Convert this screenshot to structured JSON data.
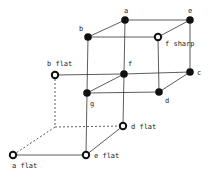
{
  "diagram": {
    "type": "key-relationship cube",
    "nodes": [
      {
        "id": "a",
        "label": "a",
        "x": 125,
        "y": 20,
        "style": "filled",
        "lx": 124,
        "ly": 13
      },
      {
        "id": "e",
        "label": "e",
        "x": 190,
        "y": 20,
        "style": "filled",
        "lx": 188,
        "ly": 13
      },
      {
        "id": "b",
        "label": "b",
        "x": 88,
        "y": 37,
        "style": "filled",
        "lx": 79,
        "ly": 31
      },
      {
        "id": "f_sharp",
        "label": "f sharp",
        "x": 158,
        "y": 37,
        "style": "open",
        "lx": 165,
        "ly": 46
      },
      {
        "id": "f",
        "label": "f",
        "x": 124,
        "y": 74,
        "style": "filled",
        "lx": 128,
        "ly": 66
      },
      {
        "id": "c",
        "label": "c",
        "x": 190,
        "y": 72,
        "style": "filled",
        "lx": 197,
        "ly": 75
      },
      {
        "id": "b_flat",
        "label": "b flat",
        "x": 55,
        "y": 75,
        "style": "open",
        "lx": 47,
        "ly": 66
      },
      {
        "id": "g",
        "label": "g",
        "x": 87,
        "y": 93,
        "style": "filled",
        "lx": 90,
        "ly": 106
      },
      {
        "id": "d",
        "label": "d",
        "x": 159,
        "y": 92,
        "style": "filled",
        "lx": 165,
        "ly": 103
      },
      {
        "id": "d_flat",
        "label": "d flat",
        "x": 123,
        "y": 126,
        "style": "open",
        "lx": 131,
        "ly": 129
      },
      {
        "id": "e_flat",
        "label": "e flat",
        "x": 86,
        "y": 155,
        "style": "open",
        "lx": 94,
        "ly": 158
      },
      {
        "id": "a_flat",
        "label": "a flat",
        "x": 13,
        "y": 155,
        "style": "open",
        "lx": 12,
        "ly": 168
      }
    ],
    "edges": [
      [
        "a",
        "e"
      ],
      [
        "a",
        "b"
      ],
      [
        "b",
        "f_sharp"
      ],
      [
        "e",
        "f_sharp"
      ],
      [
        "a",
        "f"
      ],
      [
        "e",
        "c"
      ],
      [
        "b",
        "g"
      ],
      [
        "f_sharp",
        "d"
      ],
      [
        "f",
        "c"
      ],
      [
        "g",
        "d"
      ],
      [
        "f",
        "g"
      ],
      [
        "c",
        "d"
      ],
      [
        "b_flat",
        "f"
      ],
      [
        "f",
        "d_flat"
      ],
      [
        "g",
        "e_flat"
      ],
      [
        "e_flat",
        "d_flat"
      ],
      [
        "a_flat",
        "e_flat"
      ]
    ],
    "dashed_edges": [
      {
        "x1": 55,
        "y1": 75,
        "x2": 55,
        "y2": 127
      },
      {
        "x1": 55,
        "y1": 127,
        "x2": 123,
        "y2": 126
      },
      {
        "x1": 55,
        "y1": 127,
        "x2": 13,
        "y2": 155
      }
    ]
  }
}
